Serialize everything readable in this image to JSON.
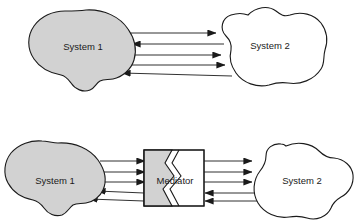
{
  "diagram": {
    "background_color": "#ffffff",
    "stroke_color": "#1a1a1a",
    "shaded_fill": "#d2d2d2",
    "plain_fill": "#ffffff",
    "panels": [
      {
        "id": "panel-direct",
        "name": "direct-coupling-panel",
        "nodes": [
          {
            "id": "top-system-1",
            "name": "system-1-blob",
            "label": "System 1",
            "shape": "cloud",
            "fill": "#d2d2d2",
            "cx": 84,
            "cy": 48
          },
          {
            "id": "top-system-2",
            "name": "system-2-blob",
            "label": "System 2",
            "shape": "cloud",
            "fill": "#ffffff",
            "cx": 268,
            "cy": 46
          }
        ],
        "connectors": [
          {
            "id": "t1",
            "name": "connector-s1-to-s2-a",
            "from": "top-system-1",
            "to": "top-system-2",
            "direction": "right",
            "y": 33
          },
          {
            "id": "t2",
            "name": "connector-s2-to-s1-a",
            "from": "top-system-2",
            "to": "top-system-1",
            "direction": "left",
            "y": 44
          },
          {
            "id": "t3",
            "name": "connector-s1-to-s2-b",
            "from": "top-system-1",
            "to": "top-system-2",
            "direction": "right",
            "y": 55
          },
          {
            "id": "t4",
            "name": "connector-s1-to-s2-c",
            "from": "top-system-1",
            "to": "top-system-2",
            "direction": "right",
            "y": 65
          },
          {
            "id": "t5",
            "name": "connector-s2-to-s1-b",
            "from": "top-system-2",
            "to": "top-system-1",
            "direction": "left",
            "y": 76
          }
        ]
      },
      {
        "id": "panel-mediated",
        "name": "mediated-coupling-panel",
        "nodes": [
          {
            "id": "bot-system-1",
            "name": "system-1-blob",
            "label": "System 1",
            "shape": "cloud",
            "fill": "#d2d2d2",
            "cx": 62,
            "cy": 181
          },
          {
            "id": "mediator",
            "name": "mediator-box",
            "label": "Mediator",
            "shape": "torn-rectangle",
            "fill_left": "#d2d2d2",
            "fill_right": "#ffffff",
            "x": 144,
            "y": 150,
            "width": 60,
            "height": 56
          },
          {
            "id": "bot-system-2",
            "name": "system-2-blob",
            "label": "System 2",
            "shape": "cloud",
            "fill": "#ffffff",
            "cx": 294,
            "cy": 181
          }
        ],
        "connectors": [
          {
            "id": "b1",
            "name": "connector-s1-to-mediator-a",
            "from": "bot-system-1",
            "to": "mediator",
            "direction": "right",
            "y": 161
          },
          {
            "id": "b2",
            "name": "connector-s1-to-mediator-b",
            "from": "bot-system-1",
            "to": "mediator",
            "direction": "right",
            "y": 172
          },
          {
            "id": "b3",
            "name": "connector-s1-to-mediator-c",
            "from": "bot-system-1",
            "to": "mediator",
            "direction": "right",
            "y": 182
          },
          {
            "id": "b4",
            "name": "connector-mediator-to-s1-a",
            "from": "mediator",
            "to": "bot-system-1",
            "direction": "left",
            "y": 193
          },
          {
            "id": "b5",
            "name": "connector-mediator-to-s1-b",
            "from": "mediator",
            "to": "bot-system-1",
            "direction": "left",
            "y": 201
          },
          {
            "id": "b6",
            "name": "connector-mediator-to-s2-a",
            "from": "mediator",
            "to": "bot-system-2",
            "direction": "right",
            "y": 161
          },
          {
            "id": "b7",
            "name": "connector-mediator-to-s2-b",
            "from": "mediator",
            "to": "bot-system-2",
            "direction": "right",
            "y": 172
          },
          {
            "id": "b8",
            "name": "connector-mediator-to-s2-c",
            "from": "mediator",
            "to": "bot-system-2",
            "direction": "right",
            "y": 182
          },
          {
            "id": "b9",
            "name": "connector-s2-to-mediator-a",
            "from": "bot-system-2",
            "to": "mediator",
            "direction": "left",
            "y": 193
          },
          {
            "id": "b10",
            "name": "connector-s2-to-mediator-b",
            "from": "bot-system-2",
            "to": "mediator",
            "direction": "left",
            "y": 201
          }
        ]
      }
    ],
    "labels": {
      "top_system_1": "System 1",
      "top_system_2": "System 2",
      "bottom_system_1": "System 1",
      "bottom_system_2": "System 2",
      "mediator": "Mediator"
    }
  }
}
